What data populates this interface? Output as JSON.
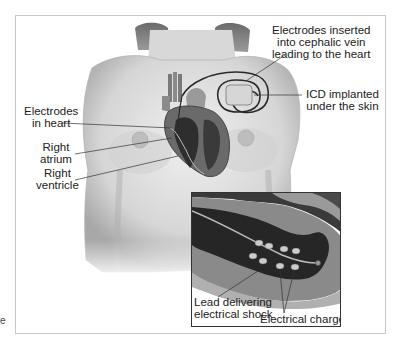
{
  "figure": {
    "labels": {
      "electrodes_vein": [
        "Electrodes inserted",
        "into cephalic vein",
        "leading to the heart"
      ],
      "icd": [
        "ICD implanted",
        "under the skin"
      ],
      "electrodes_heart": [
        "Electrodes",
        "in heart"
      ],
      "right_atrium": [
        "Right",
        "atrium"
      ],
      "right_ventricle": [
        "Right",
        "ventricle"
      ]
    },
    "inset": {
      "labels": {
        "lead": [
          "Lead delivering",
          "electrical shock"
        ],
        "charge": "Electrical charge"
      }
    },
    "stray_mark": "e"
  },
  "colors": {
    "skin_light": "#e6e6e6",
    "skin_mid": "#c9c9c9",
    "skin_dark": "#9a9a9a",
    "heart_dark": "#3a3a3a",
    "heart_chamber": "#2b2b2b",
    "heart_wall": "#8c8c8c",
    "leader_line": "#333333",
    "frame_border": "#c8c8c8"
  }
}
